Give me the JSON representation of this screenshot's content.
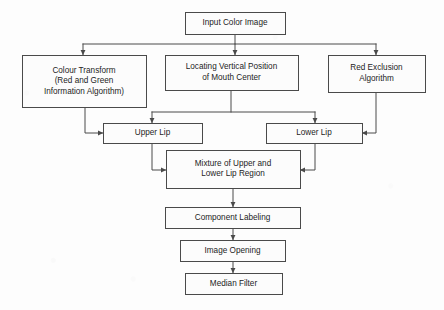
{
  "diagram": {
    "type": "flowchart",
    "background_color": "#fdfdfd",
    "box_fill_color": "#fcfcfc",
    "line_color": "#4a4a4a",
    "text_color": "#1d1d1d",
    "nodes": [
      {
        "id": "input-color-image",
        "lines": [
          "Input Color Image"
        ],
        "x": 185,
        "y": 12,
        "w": 100,
        "h": 22
      },
      {
        "id": "colour-transform",
        "lines": [
          "Colour Transform",
          "(Red and Green",
          "Information Algorithm)"
        ],
        "x": 22,
        "y": 55,
        "w": 124,
        "h": 52
      },
      {
        "id": "locating-vertical-position",
        "lines": [
          "Locating Vertical Position",
          "of Mouth Center"
        ],
        "x": 165,
        "y": 55,
        "w": 133,
        "h": 35
      },
      {
        "id": "red-exclusion-algorithm",
        "lines": [
          "Red Exclusion",
          "Algorithm"
        ],
        "x": 328,
        "y": 55,
        "w": 97,
        "h": 37
      },
      {
        "id": "upper-lip",
        "lines": [
          "Upper Lip"
        ],
        "x": 103,
        "y": 123,
        "w": 99,
        "h": 20
      },
      {
        "id": "lower-lip",
        "lines": [
          "Lower Lip"
        ],
        "x": 266,
        "y": 123,
        "w": 96,
        "h": 20
      },
      {
        "id": "mixture-upper-lower-lip",
        "lines": [
          "Mixture of Upper and",
          "Lower Lip Region"
        ],
        "x": 166,
        "y": 150,
        "w": 134,
        "h": 38
      },
      {
        "id": "component-labeling",
        "lines": [
          "Component Labeling"
        ],
        "x": 165,
        "y": 207,
        "w": 135,
        "h": 21
      },
      {
        "id": "image-opening",
        "lines": [
          "Image Opening"
        ],
        "x": 180,
        "y": 240,
        "w": 105,
        "h": 21
      },
      {
        "id": "median-filter",
        "lines": [
          "Median Filter"
        ],
        "x": 185,
        "y": 273,
        "w": 97,
        "h": 21
      }
    ],
    "edges": [
      {
        "id": "input-to-bus",
        "from": "input-color-image",
        "to": "distribution-bus",
        "path": "M 235,34 L 235,44",
        "arrow": false
      },
      {
        "id": "distribution-bus",
        "from": "input-color-image",
        "to": "three-branches",
        "path": "M 83,44 L 376,44",
        "arrow": false
      },
      {
        "id": "bus-to-colour-transform",
        "from": "distribution-bus",
        "to": "colour-transform",
        "path": "M 83,44 L 83,55",
        "arrow": true
      },
      {
        "id": "bus-to-locating-vertical",
        "from": "distribution-bus",
        "to": "locating-vertical-position",
        "path": "M 235,44 L 235,55",
        "arrow": true
      },
      {
        "id": "bus-to-red-exclusion",
        "from": "distribution-bus",
        "to": "red-exclusion-algorithm",
        "path": "M 376,44 L 376,55",
        "arrow": true
      },
      {
        "id": "colour-transform-to-upper-lip",
        "from": "colour-transform",
        "to": "upper-lip",
        "path": "M 85,107 L 85,133 L 103,133",
        "arrow": true
      },
      {
        "id": "locating-vertical-down",
        "from": "locating-vertical-position",
        "to": "lip-split-bus",
        "path": "M 231,90 L 231,112",
        "arrow": false
      },
      {
        "id": "lip-split-bus",
        "from": "locating-vertical-position",
        "to": "upper-and-lower-lip",
        "path": "M 152,112 L 315,112",
        "arrow": false
      },
      {
        "id": "split-to-upper-lip",
        "from": "lip-split-bus",
        "to": "upper-lip",
        "path": "M 152,112 L 152,123",
        "arrow": true
      },
      {
        "id": "split-to-lower-lip",
        "from": "lip-split-bus",
        "to": "lower-lip",
        "path": "M 315,112 L 315,123",
        "arrow": true
      },
      {
        "id": "red-exclusion-to-lower-lip",
        "from": "red-exclusion-algorithm",
        "to": "lower-lip",
        "path": "M 376,92 L 376,133 L 362,133",
        "arrow": true
      },
      {
        "id": "upper-lip-to-mixture",
        "from": "upper-lip",
        "to": "mixture-upper-lower-lip",
        "path": "M 152,143 L 152,170 L 166,170",
        "arrow": true
      },
      {
        "id": "lower-lip-to-mixture",
        "from": "lower-lip",
        "to": "mixture-upper-lower-lip",
        "path": "M 315,143 L 315,170 L 300,170",
        "arrow": true
      },
      {
        "id": "mixture-to-component-labeling",
        "from": "mixture-upper-lower-lip",
        "to": "component-labeling",
        "path": "M 233,188 L 233,207",
        "arrow": true
      },
      {
        "id": "component-labeling-to-image-opening",
        "from": "component-labeling",
        "to": "image-opening",
        "path": "M 233,228 L 233,240",
        "arrow": true
      },
      {
        "id": "image-opening-to-median-filter",
        "from": "image-opening",
        "to": "median-filter",
        "path": "M 233,261 L 233,273",
        "arrow": true
      }
    ]
  }
}
